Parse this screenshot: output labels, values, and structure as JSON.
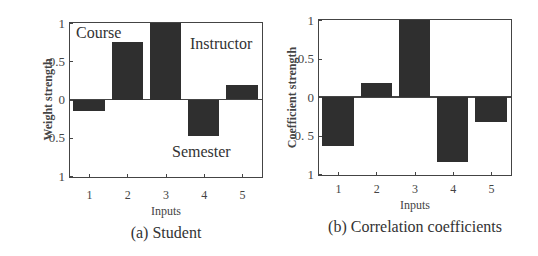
{
  "chart_data": [
    {
      "type": "bar",
      "title": "(a) Student",
      "xlabel": "Inputs",
      "ylabel": "Weight strength",
      "categories": [
        "1",
        "2",
        "3",
        "4",
        "5"
      ],
      "values": [
        -0.15,
        0.75,
        1.0,
        -0.48,
        0.19
      ],
      "ylim": [
        -1,
        1
      ],
      "yticks": [
        "1",
        "0.5",
        "0",
        "0.5",
        "1"
      ],
      "annotations": [
        "Course",
        "Instructor",
        "Semester"
      ],
      "grid": false,
      "bar_color": "#2f2f2f"
    },
    {
      "type": "bar",
      "title": "(b) Correlation coefficients",
      "xlabel": "Inputs",
      "ylabel": "Coefficient strength",
      "categories": [
        "1",
        "2",
        "3",
        "4",
        "5"
      ],
      "values": [
        -0.63,
        0.18,
        1.0,
        -0.85,
        -0.33
      ],
      "ylim": [
        -1,
        1
      ],
      "yticks": [
        "1",
        "0.5",
        "0",
        "0. 5",
        "1"
      ],
      "grid": false,
      "bar_color": "#2f2f2f"
    }
  ]
}
